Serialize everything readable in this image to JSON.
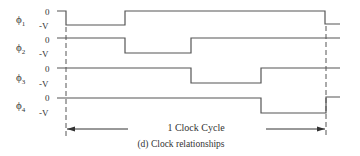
{
  "diagram": {
    "caption": "(d) Clock relationships",
    "cycle_label": "1 Clock Cycle",
    "signals": [
      {
        "name": "ϕ1",
        "sub": "1",
        "high_label": "0",
        "low_label": "-V"
      },
      {
        "name": "ϕ2",
        "sub": "2",
        "high_label": "0",
        "low_label": "-V"
      },
      {
        "name": "ϕ3",
        "sub": "3",
        "high_label": "0",
        "low_label": "-V"
      },
      {
        "name": "ϕ4",
        "sub": "4",
        "high_label": "0",
        "low_label": "-V"
      }
    ],
    "phi": "ϕ",
    "colors": {
      "line": "#555555",
      "text": "#333333",
      "background": "#ffffff"
    }
  }
}
